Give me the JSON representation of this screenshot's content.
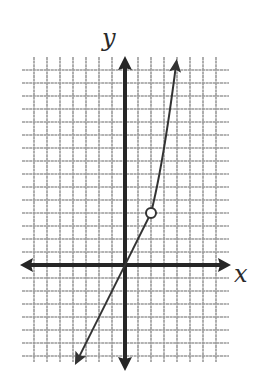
{
  "chart_data": {
    "type": "line",
    "title": "",
    "xlabel": "x",
    "ylabel": "y",
    "grid": true,
    "xlim": [
      -8,
      8
    ],
    "ylim": [
      -8,
      16
    ],
    "pixel_origin": [
      125,
      265
    ],
    "unit_px": 13,
    "series": [
      {
        "name": "linear piece",
        "rule": "y = 2x, x < 2",
        "x": [
          -4,
          -3,
          -2,
          -1,
          0,
          1,
          2
        ],
        "y": [
          -8,
          -6,
          -4,
          -2,
          0,
          2,
          4
        ],
        "arrow_at": "start"
      },
      {
        "name": "quadratic piece",
        "rule": "y = x^2, x > 2",
        "x": [
          2,
          2.5,
          3,
          3.5,
          4
        ],
        "y": [
          4,
          6.25,
          9,
          12.25,
          16
        ],
        "arrow_at": "end"
      }
    ],
    "annotations": [
      {
        "type": "open-circle",
        "x": 2,
        "y": 4
      }
    ]
  },
  "labels": {
    "x_axis": "x",
    "y_axis": "y"
  },
  "colors": {
    "axis": "#262626",
    "grid": "#9a9a9a",
    "curve": "#333333",
    "background": "#ffffff"
  }
}
